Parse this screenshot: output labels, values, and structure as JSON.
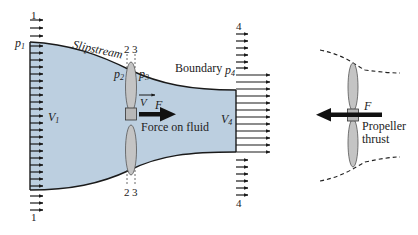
{
  "colors": {
    "fluid_fill": "#bccfe0",
    "outline": "#1a1a1a",
    "blade_fill": "#c4c4c4",
    "hub_fill": "#b8b8b8",
    "background": "#ffffff"
  },
  "labels": {
    "station_1_top": "1",
    "station_1_bottom": "1",
    "station_2_top": "2",
    "station_3_top": "3",
    "station_2_bottom": "2",
    "station_3_bottom": "3",
    "station_4_top": "4",
    "station_4_bottom": "4",
    "p1": "p",
    "p1_sub": "1",
    "p2": "p",
    "p2_sub": "2",
    "p3": "p",
    "p3_sub": "3",
    "p4": "p",
    "p4_sub": "4",
    "v1": "V",
    "v1_sub": "1",
    "v4": "V",
    "v4_sub": "4",
    "v": "V",
    "slipstream": "Slipstream",
    "boundary": "Boundary",
    "force": "F",
    "force_on_fluid": "Force on fluid",
    "propeller_force": "F",
    "propeller_line1": "Propeller",
    "propeller_line2": "thrust"
  }
}
